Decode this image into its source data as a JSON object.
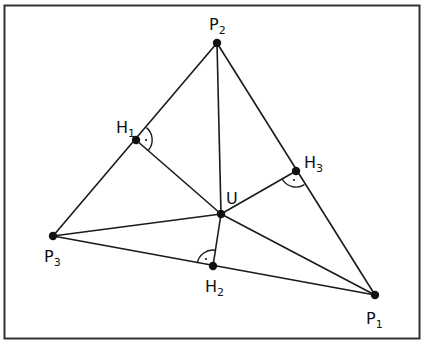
{
  "diagram": {
    "colors": {
      "stroke": "#1a1a1a",
      "background": "#ffffff",
      "frame": "#333333"
    },
    "frame": {
      "x": 4,
      "y": 5,
      "width": 416,
      "height": 334
    },
    "points": {
      "P1": {
        "x": 375,
        "y": 295,
        "label": "P",
        "sub": "1",
        "lx": 366,
        "ly": 326
      },
      "P2": {
        "x": 217,
        "y": 43,
        "label": "P",
        "sub": "2",
        "lx": 209,
        "ly": 26
      },
      "P3": {
        "x": 53,
        "y": 236,
        "label": "P",
        "sub": "3",
        "lx": 44,
        "ly": 264
      },
      "H1": {
        "x": 136,
        "y": 140,
        "label": "H",
        "sub": "1",
        "lx": 116,
        "ly": 133
      },
      "H2": {
        "x": 213,
        "y": 266,
        "label": "H",
        "sub": "2",
        "lx": 205,
        "ly": 292
      },
      "H3": {
        "x": 296,
        "y": 171,
        "label": "H",
        "sub": "3",
        "lx": 304,
        "ly": 166
      },
      "U": {
        "x": 221,
        "y": 214,
        "label": "U",
        "sub": "",
        "lx": 226,
        "ly": 202
      }
    },
    "labels": {
      "P1": "P",
      "P1_sub": "1",
      "P2": "P",
      "P2_sub": "2",
      "P3": "P",
      "P3_sub": "3",
      "H1": "H",
      "H1_sub": "1",
      "H2": "H",
      "H2_sub": "2",
      "H3": "H",
      "H3_sub": "3",
      "U": "U"
    },
    "segments": [
      [
        "P1",
        "P2"
      ],
      [
        "P2",
        "P3"
      ],
      [
        "P3",
        "P1"
      ],
      [
        "P2",
        "U"
      ],
      [
        "P3",
        "U"
      ],
      [
        "P1",
        "U"
      ],
      [
        "H1",
        "U"
      ],
      [
        "H2",
        "U"
      ],
      [
        "H3",
        "U"
      ]
    ],
    "right_angle_marks": [
      "H1",
      "H2",
      "H3"
    ]
  }
}
